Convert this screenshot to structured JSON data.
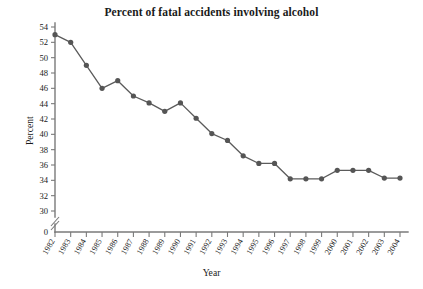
{
  "chart_data": {
    "type": "line",
    "title": "Percent of fatal accidents involving alcohol",
    "xlabel": "Year",
    "ylabel": "Percent",
    "categories": [
      "1982",
      "1983",
      "1984",
      "1985",
      "1986",
      "1987",
      "1988",
      "1989",
      "1990",
      "1991",
      "1992",
      "1993",
      "1994",
      "1995",
      "1996",
      "1997",
      "1998",
      "1999",
      "2000",
      "2001",
      "2002",
      "2003",
      "2004"
    ],
    "values": [
      53.0,
      52.0,
      49.0,
      46.0,
      47.0,
      45.0,
      44.1,
      43.0,
      44.1,
      42.1,
      40.1,
      39.2,
      37.2,
      36.2,
      36.2,
      34.2,
      34.2,
      34.2,
      35.3,
      35.3,
      35.3,
      34.3,
      34.3
    ],
    "ylim": [
      30,
      54
    ],
    "ytick_values": [
      30,
      32,
      34,
      36,
      38,
      40,
      42,
      44,
      46,
      48,
      50,
      52,
      54
    ],
    "ytick_labels": [
      "30",
      "32",
      "34",
      "36",
      "38",
      "40",
      "42",
      "44",
      "46",
      "48",
      "50",
      "52",
      "54"
    ],
    "y_origin_label": "0",
    "axis_break": true,
    "grid": false,
    "legend": false,
    "series_color": "#555555",
    "line_color": "#5b5b5b",
    "axis_color": "#7a7a7a"
  }
}
